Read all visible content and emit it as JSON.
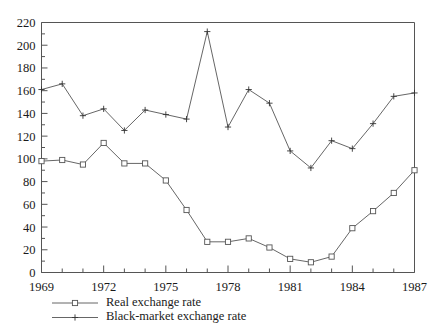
{
  "chart_data": {
    "type": "line",
    "title": "",
    "subtitle": "",
    "xlabel": "",
    "ylabel": "",
    "xlim": [
      1969,
      1987
    ],
    "ylim": [
      0,
      220
    ],
    "yticks": [
      0,
      20,
      40,
      60,
      80,
      100,
      120,
      140,
      160,
      180,
      200,
      220
    ],
    "ytick_labels": [
      "0",
      "20",
      "40",
      "60",
      "80",
      "100",
      "120",
      "140",
      "160",
      "180",
      "200",
      "220"
    ],
    "xticks": [
      1969,
      1972,
      1975,
      1978,
      1981,
      1984,
      1987
    ],
    "xtick_labels": [
      "1969",
      "1972",
      "1975",
      "1978",
      "1981",
      "1984",
      "1987"
    ],
    "x_minor_ticks": [
      1970,
      1971,
      1973,
      1974,
      1976,
      1977,
      1979,
      1980,
      1982,
      1983,
      1985,
      1986
    ],
    "y_minor_step": 10,
    "grid": false,
    "legend_position": "below-left",
    "frame": "box",
    "x": [
      1969,
      1970,
      1971,
      1972,
      1973,
      1974,
      1975,
      1976,
      1977,
      1978,
      1979,
      1980,
      1981,
      1982,
      1983,
      1984,
      1985,
      1986,
      1987
    ],
    "series": [
      {
        "name": "Real exchange rate",
        "marker": "square",
        "values": [
          98,
          99,
          95,
          114,
          96,
          96,
          81,
          55,
          27,
          27,
          30,
          22,
          12,
          9,
          14,
          39,
          54,
          70,
          90
        ]
      },
      {
        "name": "Black-market exchange rate",
        "marker": "plus",
        "values": [
          161,
          166,
          138,
          144,
          125,
          143,
          139,
          135,
          212,
          128,
          161,
          149,
          107,
          92,
          116,
          109,
          131,
          155,
          158
        ]
      }
    ]
  },
  "legend": {
    "entries": [
      {
        "label": "Real exchange rate",
        "marker": "square"
      },
      {
        "label": "Black-market exchange rate",
        "marker": "plus"
      }
    ]
  },
  "colors": {
    "line": "#555555",
    "marker_fill": "#ffffff",
    "text": "#1a1a1a",
    "background": "#ffffff"
  }
}
